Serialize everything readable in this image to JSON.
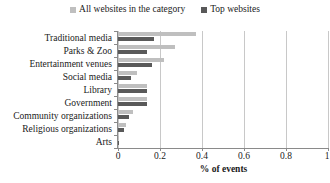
{
  "legend": {
    "position": "top-center",
    "items": [
      {
        "label": "All websites in the category",
        "color": "#bfbfbf",
        "marker": "square-swatch-icon"
      },
      {
        "label": "Top websites",
        "color": "#595959",
        "marker": "square-swatch-icon"
      }
    ]
  },
  "axis": {
    "x_title": "% of events",
    "x_ticks": [
      "0",
      "0.2",
      "0.4",
      "0.6",
      "0.8",
      "1"
    ],
    "y_ticks": [
      "Traditional media",
      "Parks & Zoo",
      "Entertainment venues",
      "Social media",
      "Library",
      "Government",
      "Community organizations",
      "Religious organizations",
      "Arts"
    ]
  },
  "chart_data": {
    "type": "bar",
    "orientation": "horizontal",
    "title": "",
    "subtitle": "",
    "xlabel": "% of events",
    "ylabel": "",
    "xlim": [
      0,
      1
    ],
    "xticks": [
      0,
      0.2,
      0.4,
      0.6,
      0.8,
      1
    ],
    "grid": "vertical",
    "legend_position": "top-center",
    "categories": [
      "Traditional media",
      "Parks & Zoo",
      "Entertainment venues",
      "Social media",
      "Library",
      "Government",
      "Community organizations",
      "Religious organizations",
      "Arts"
    ],
    "series": [
      {
        "name": "All websites in the category",
        "color": "#bfbfbf",
        "values": [
          0.37,
          0.27,
          0.22,
          0.09,
          0.14,
          0.14,
          0.07,
          0.04,
          0.005
        ]
      },
      {
        "name": "Top websites",
        "color": "#595959",
        "values": [
          0.17,
          0.14,
          0.16,
          0.06,
          0.14,
          0.14,
          0.05,
          0.03,
          0.005
        ]
      }
    ]
  }
}
